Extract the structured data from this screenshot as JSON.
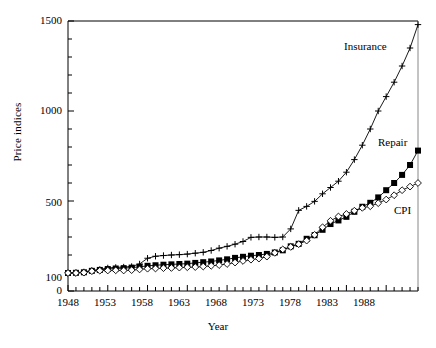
{
  "chart_data": {
    "type": "line",
    "title": "",
    "xlabel": "Year",
    "ylabel": "Price indices",
    "xlim": [
      1948,
      1992
    ],
    "ylim": [
      0,
      1500
    ],
    "grid": false,
    "legend_position": "inline-right-of-series-end",
    "y_ticks": [
      0,
      100,
      500,
      1000,
      1500
    ],
    "y_tick_labels": [
      "0",
      "100",
      "500",
      "1000",
      "1500"
    ],
    "y_minor_tick_step": 100,
    "x_ticks": [
      1948,
      1953,
      1958,
      1963,
      1968,
      1973,
      1978,
      1983,
      1988
    ],
    "x_tick_labels": [
      "1948",
      "1953",
      "1958",
      "1963",
      "1968",
      "1973",
      "1978",
      "1983",
      "1988"
    ],
    "x_minor_tick_step": 1,
    "x": [
      1948,
      1949,
      1950,
      1951,
      1952,
      1953,
      1954,
      1955,
      1956,
      1957,
      1958,
      1959,
      1960,
      1961,
      1962,
      1963,
      1964,
      1965,
      1966,
      1967,
      1968,
      1969,
      1970,
      1971,
      1972,
      1973,
      1974,
      1975,
      1976,
      1977,
      1978,
      1979,
      1980,
      1981,
      1982,
      1983,
      1984,
      1985,
      1986,
      1987,
      1988,
      1989,
      1990,
      1991,
      1992
    ],
    "series": [
      {
        "name": "Insurance",
        "marker": "plus",
        "color": "#000000",
        "values": [
          100,
          102,
          106,
          114,
          120,
          128,
          131,
          133,
          136,
          150,
          182,
          193,
          197,
          200,
          202,
          205,
          210,
          215,
          225,
          238,
          248,
          260,
          275,
          298,
          300,
          300,
          298,
          300,
          345,
          448,
          470,
          498,
          540,
          575,
          610,
          660,
          730,
          810,
          900,
          1000,
          1080,
          1160,
          1250,
          1350,
          1480
        ]
      },
      {
        "name": "Repair",
        "marker": "filled-square",
        "color": "#000000",
        "values": [
          100,
          101,
          104,
          112,
          117,
          122,
          125,
          127,
          130,
          134,
          140,
          143,
          146,
          148,
          150,
          152,
          156,
          160,
          164,
          170,
          176,
          184,
          190,
          196,
          200,
          206,
          214,
          226,
          248,
          262,
          290,
          310,
          340,
          372,
          392,
          412,
          440,
          468,
          490,
          520,
          560,
          600,
          645,
          700,
          780
        ]
      },
      {
        "name": "CPI",
        "marker": "open-diamond",
        "color": "#000000",
        "values": [
          100,
          100,
          102,
          110,
          113,
          114,
          115,
          114,
          116,
          120,
          124,
          125,
          127,
          128,
          130,
          132,
          133,
          136,
          140,
          144,
          150,
          158,
          167,
          174,
          180,
          191,
          212,
          231,
          245,
          260,
          280,
          312,
          354,
          390,
          414,
          428,
          446,
          462,
          471,
          488,
          508,
          532,
          560,
          580,
          600
        ]
      }
    ],
    "annotations": [
      {
        "text": "Insurance",
        "series": "Insurance"
      },
      {
        "text": "Repair",
        "series": "Repair"
      },
      {
        "text": "CPI",
        "series": "CPI"
      }
    ]
  }
}
